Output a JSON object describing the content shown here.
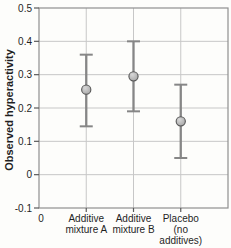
{
  "chart_data": {
    "type": "scatter",
    "title": "",
    "xlabel": "",
    "ylabel": "Observed hyperactivity",
    "ylim": [
      -0.1,
      0.5
    ],
    "yticks": [
      {
        "value": 0.5,
        "label": "0.5"
      },
      {
        "value": 0.4,
        "label": "0.4"
      },
      {
        "value": 0.3,
        "label": "0.3"
      },
      {
        "value": 0.2,
        "label": "0.2"
      },
      {
        "value": 0.1,
        "label": "0.1"
      },
      {
        "value": 0.0,
        "label": "0"
      },
      {
        "value": -0.1,
        "label": "-0.1"
      }
    ],
    "x_origin_label": "0",
    "grid": "both",
    "legend": "none",
    "categories": [
      "Additive mixture A",
      "Additive mixture B",
      "Placebo (no additives)"
    ],
    "category_label_lines": [
      [
        "Additive",
        "mixture A"
      ],
      [
        "Additive",
        "mixture B"
      ],
      [
        "Placebo",
        "(no",
        "additives)"
      ]
    ],
    "points": [
      {
        "category": "Additive mixture A",
        "mean": 0.255,
        "ci_low": 0.145,
        "ci_high": 0.36
      },
      {
        "category": "Additive mixture B",
        "mean": 0.295,
        "ci_low": 0.19,
        "ci_high": 0.4
      },
      {
        "category": "Placebo (no additives)",
        "mean": 0.16,
        "ci_low": 0.05,
        "ci_high": 0.27
      }
    ]
  },
  "colors": {
    "background": "#fdfdfb",
    "plot_border": "#8f8f8f",
    "gridline": "#c7c7c7",
    "tick": "#5a5a5a",
    "error_bar": "#868686",
    "marker_fill": "#a6a6a6",
    "marker_highlight": "#d8d8d8",
    "marker_edge": "#565656",
    "text": "#1f1f1f"
  }
}
